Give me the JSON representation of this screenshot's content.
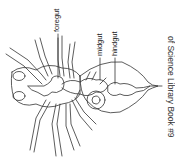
{
  "diagram": {
    "labels": {
      "foregut": "foregut",
      "midgut": "midgut",
      "hindgut": "hindgut"
    },
    "caption": "of Science Library Book #9",
    "colors": {
      "line": "#333333",
      "background": "#ffffff"
    }
  }
}
